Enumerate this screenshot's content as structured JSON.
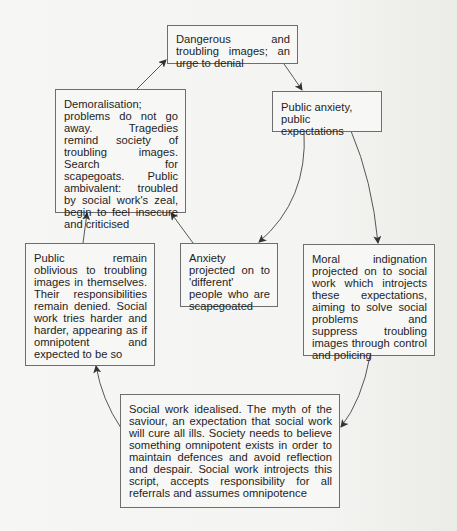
{
  "diagram": {
    "nodes": [
      {
        "id": "dangerous-images",
        "text": "Dangerous and troubling images; an urge to denial"
      },
      {
        "id": "public-anxiety",
        "text": "Public anxiety, public expectations"
      },
      {
        "id": "moral-indignation",
        "text": "Moral indignation projected on to social work which introjects these expectations, aiming to solve social problems and suppress troubling images through control and policing"
      },
      {
        "id": "social-work-idealised",
        "text": "Social work idealised. The myth of the saviour, an expectation that social work will cure all ills. Society needs to believe something omnipotent exists in order to maintain defences and avoid reflection and despair. Social work introjects this script, accepts responsibility for all referrals and assumes omnipotence"
      },
      {
        "id": "public-oblivious",
        "text": "Public remain oblivious to troubling images in themselves. Their responsibilities remain denied. Social work tries harder and harder, appearing as if omnipotent and expected to be so"
      },
      {
        "id": "demoralisation",
        "text": "Demoralisation; problems do not go away. Tragedies remind society of troubling images. Search for scapegoats. Public ambivalent: troubled by social work's zeal, begin to feel insecure and criticised"
      },
      {
        "id": "anxiety-projected",
        "text": "Anxiety projected on to 'different' people who are scapegoated"
      }
    ],
    "edges": [
      {
        "from": "dangerous-images",
        "to": "public-anxiety"
      },
      {
        "from": "public-anxiety",
        "to": "moral-indignation"
      },
      {
        "from": "public-anxiety",
        "to": "anxiety-projected"
      },
      {
        "from": "moral-indignation",
        "to": "social-work-idealised"
      },
      {
        "from": "social-work-idealised",
        "to": "public-oblivious"
      },
      {
        "from": "public-oblivious",
        "to": "demoralisation"
      },
      {
        "from": "anxiety-projected",
        "to": "demoralisation"
      },
      {
        "from": "demoralisation",
        "to": "dangerous-images"
      }
    ],
    "colors": {
      "border": "#6e6e6e",
      "arrow": "#333333",
      "text": "#1e1e1e"
    }
  }
}
